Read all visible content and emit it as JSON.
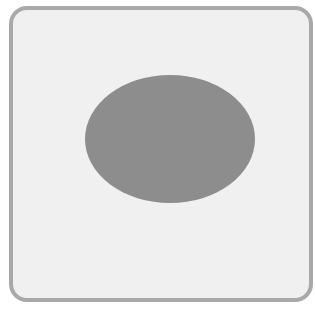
{
  "figure": {
    "frame": {
      "shape": "rounded-square",
      "fill_color": "#f0f0f0",
      "border_color": "#a9a9a9"
    },
    "ellipse": {
      "shape": "ellipse",
      "fill_color": "#8d8d8d"
    }
  }
}
